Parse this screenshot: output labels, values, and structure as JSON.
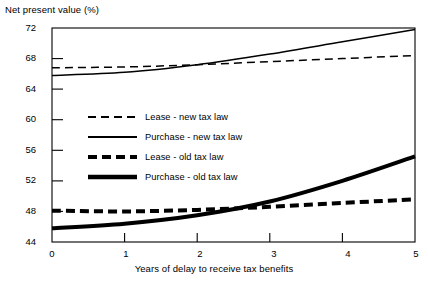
{
  "chart_data": {
    "type": "line",
    "title": "",
    "ylabel": "Net present value (%)",
    "xlabel": "Years of delay to receive tax benefits",
    "xlim": [
      0,
      5
    ],
    "ylim": [
      44,
      72
    ],
    "yticks": [
      44,
      48,
      52,
      56,
      60,
      64,
      68,
      72
    ],
    "xticks": [
      0,
      1,
      2,
      3,
      4,
      5
    ],
    "grid": false,
    "legend_position": "center-left-inside",
    "x": [
      0,
      1,
      2,
      3,
      4,
      5
    ],
    "series": [
      {
        "name": "Lease - new tax law",
        "style": "dashed-thin",
        "values": [
          66.8,
          66.9,
          67.2,
          67.6,
          68.0,
          68.4
        ]
      },
      {
        "name": "Purchase - new tax law",
        "style": "solid-thin",
        "values": [
          65.8,
          66.2,
          67.2,
          68.6,
          70.2,
          71.8
        ]
      },
      {
        "name": "Lease - old tax law",
        "style": "dashed-bold",
        "values": [
          48.1,
          48.0,
          48.2,
          48.6,
          49.1,
          49.6
        ]
      },
      {
        "name": "Purchase - old tax law",
        "style": "solid-bold",
        "values": [
          45.8,
          46.4,
          47.5,
          49.3,
          52.0,
          55.2
        ]
      }
    ]
  },
  "axes": {
    "y_title": "Net present value (%)",
    "x_title": "Years of delay to receive tax benefits",
    "y_tick_labels": [
      "72",
      "68",
      "64",
      "60",
      "56",
      "52",
      "48",
      "44"
    ],
    "x_tick_labels": [
      "0",
      "1",
      "2",
      "3",
      "4",
      "5"
    ]
  },
  "legend": {
    "items": [
      {
        "label": "Lease - new tax law"
      },
      {
        "label": "Purchase - new tax law"
      },
      {
        "label": "Lease - old tax law"
      },
      {
        "label": "Purchase - old tax law"
      }
    ]
  },
  "colors": {
    "ink": "#000000",
    "background": "#ffffff"
  }
}
